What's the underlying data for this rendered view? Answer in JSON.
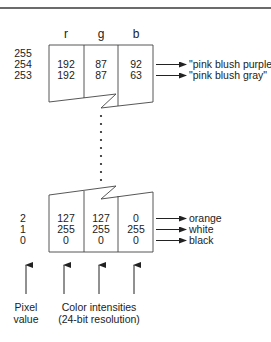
{
  "figure": {
    "columns": {
      "r": "r",
      "g": "g",
      "b": "b"
    },
    "upper_table": {
      "pixel_values": [
        "255",
        "254",
        "253"
      ],
      "rows": [
        {
          "pixel": "254",
          "r": "192",
          "g": "87",
          "b": "92",
          "label": "\"pink blush purple\""
        },
        {
          "pixel": "253",
          "r": "192",
          "g": "87",
          "b": "63",
          "label": "\"pink blush gray\""
        }
      ]
    },
    "lower_table": {
      "rows": [
        {
          "pixel": "2",
          "r": "127",
          "g": "127",
          "b": "0",
          "label": "orange"
        },
        {
          "pixel": "1",
          "r": "255",
          "g": "255",
          "b": "255",
          "label": "white"
        },
        {
          "pixel": "0",
          "r": "0",
          "g": "0",
          "b": "0",
          "label": "black"
        }
      ]
    },
    "bottom_labels": {
      "pixel_value_line1": "Pixel",
      "pixel_value_line2": "value",
      "color_line1": "Color intensities",
      "color_line2": "(24-bit resolution)"
    },
    "colors": {
      "line": "#444444",
      "text": "#222222",
      "background": "#ffffff"
    }
  }
}
